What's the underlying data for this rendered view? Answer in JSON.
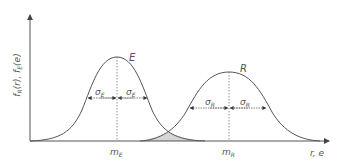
{
  "diagram": {
    "type": "overlapping-normal-distributions",
    "y_axis_label": "f_R(r), f_E(e)",
    "y_axis_label_main": "f",
    "x_axis_label": "r, e",
    "curves": [
      {
        "name": "E",
        "label": "E",
        "mean_label": "m",
        "mean_sub": "E",
        "sigma_label": "σ",
        "sigma_sub": "E"
      },
      {
        "name": "R",
        "label": "R",
        "mean_label": "m",
        "mean_sub": "R",
        "sigma_label": "σ",
        "sigma_sub": "R"
      }
    ],
    "overlap_region": "shaded interference area",
    "colors": {
      "line": "#555555",
      "shade": "#d6d6d6",
      "text": "#555555"
    }
  },
  "labels": {
    "ylabel_f1": "f",
    "ylabel_R": "R",
    "ylabel_r": "(r), ",
    "ylabel_f2": "f",
    "ylabel_E": "E",
    "ylabel_e": "(e)",
    "curve_E": "E",
    "curve_R": "R",
    "sigma": "σ",
    "sub_E": "E",
    "sub_R": "R",
    "mean_m": "m",
    "xlabel": "r, e"
  }
}
